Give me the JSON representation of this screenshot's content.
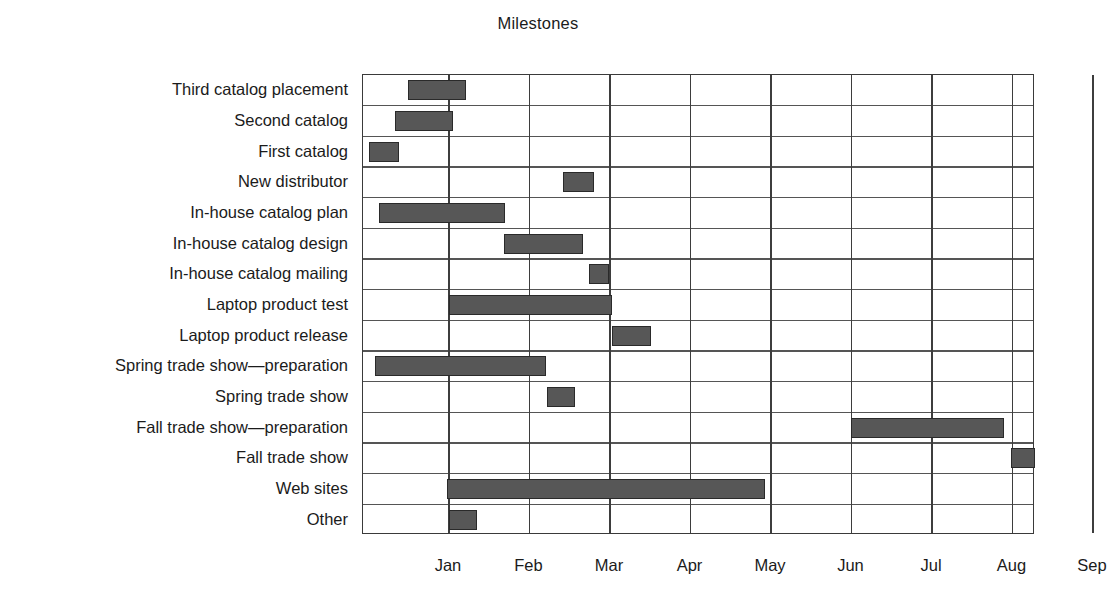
{
  "chart_data": {
    "type": "bar",
    "chart_subtype": "gantt",
    "title": "Milestones",
    "xlabel": "",
    "ylabel": "",
    "grid": true,
    "legend": false,
    "x_tick_labels": [
      "Jan",
      "Feb",
      "Mar",
      "Apr",
      "May",
      "Jun",
      "Jul",
      "Aug",
      "Sep"
    ],
    "x_tick_months": [
      1,
      2,
      3,
      4,
      5,
      6,
      7,
      8,
      9
    ],
    "xlim_months": [
      -0.07,
      9.3
    ],
    "categories": [
      "Third catalog placement",
      "Second catalog",
      "First catalog",
      "New distributor",
      "In-house catalog plan",
      "In-house catalog design",
      "In-house catalog mailing",
      "Laptop product test",
      "Laptop product release",
      "Spring trade show—preparation",
      "Spring trade show",
      "Fall trade show—preparation",
      "Fall trade show",
      "Web sites",
      "Other"
    ],
    "bars": [
      {
        "label": "Third catalog placement",
        "start_month": 0.49,
        "end_month": 1.21
      },
      {
        "label": "Second catalog",
        "start_month": 0.33,
        "end_month": 1.05
      },
      {
        "label": "First catalog",
        "start_month": 0.01,
        "end_month": 0.38
      },
      {
        "label": "New distributor",
        "start_month": 2.42,
        "end_month": 2.8
      },
      {
        "label": "In-house catalog plan",
        "start_month": 0.13,
        "end_month": 1.69
      },
      {
        "label": "In-house catalog design",
        "start_month": 1.68,
        "end_month": 2.67
      },
      {
        "label": "In-house catalog mailing",
        "start_month": 2.74,
        "end_month": 2.99
      },
      {
        "label": "Laptop product test",
        "start_month": 1.0,
        "end_month": 3.02
      },
      {
        "label": "Laptop product release",
        "start_month": 3.02,
        "end_month": 3.51
      },
      {
        "label": "Spring trade show—preparation",
        "start_month": 0.08,
        "end_month": 2.21
      },
      {
        "label": "Spring trade show",
        "start_month": 2.22,
        "end_month": 2.56
      },
      {
        "label": "Fall trade show—preparation",
        "start_month": 5.99,
        "end_month": 7.89
      },
      {
        "label": "Fall trade show",
        "start_month": 7.98,
        "end_month": 8.28
      },
      {
        "label": "Web sites",
        "start_month": 0.98,
        "end_month": 4.93
      },
      {
        "label": "Other",
        "start_month": 1.0,
        "end_month": 1.35
      }
    ],
    "bar_color": "#575757",
    "bar_edge_color": "#2a2a2a",
    "grid_color": "#3d3d3d",
    "text_color": "#1b1b1b",
    "background_color": "#ffffff"
  }
}
